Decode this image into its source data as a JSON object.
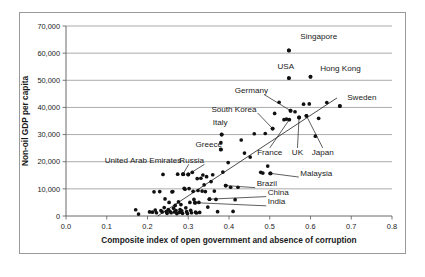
{
  "chart_data": {
    "type": "scatter",
    "title": "",
    "xlabel": "Composite index of open government and absence of corruption",
    "ylabel": "Non-oil GDP per capita",
    "xlim": [
      0.0,
      0.8
    ],
    "ylim": [
      0,
      70000
    ],
    "xticks": [
      "0.0",
      "0.1",
      "0.2",
      "0.3",
      "0.4",
      "0.5",
      "0.6",
      "0.7",
      "0.8"
    ],
    "xtick_values": [
      0.0,
      0.1,
      0.2,
      0.3,
      0.4,
      0.5,
      0.6,
      0.7,
      0.8
    ],
    "yticks": [
      "0",
      "10,000",
      "20,000",
      "30,000",
      "40,000",
      "50,000",
      "60,000",
      "70,000"
    ],
    "ytick_values": [
      0,
      10000,
      20000,
      30000,
      40000,
      50000,
      60000,
      70000
    ],
    "grid": "horizontal",
    "legend": "none",
    "marker_color": "#111111",
    "trendline": {
      "label": "linear fit",
      "x0": 0.225,
      "y0": 0,
      "x1": 0.665,
      "y1": 43500
    },
    "annotations": [
      {
        "name": "Singapore",
        "x": 0.547,
        "y": 61000,
        "label_x": 0.575,
        "label_y": 65200,
        "anchor": "start",
        "leader": false
      },
      {
        "name": "USA",
        "x": 0.547,
        "y": 50800,
        "label_x": 0.519,
        "label_y": 54300,
        "anchor": "start",
        "leader": false
      },
      {
        "name": "Hong Kong",
        "x": 0.6,
        "y": 51300,
        "label_x": 0.624,
        "label_y": 53600,
        "anchor": "start",
        "leader": false
      },
      {
        "name": "Germany",
        "x": 0.551,
        "y": 38800,
        "label_x": 0.414,
        "label_y": 45300,
        "anchor": "start",
        "leader": true
      },
      {
        "name": "Sweden",
        "x": 0.672,
        "y": 40500,
        "label_x": 0.69,
        "label_y": 42600,
        "anchor": "start",
        "leader": false
      },
      {
        "name": "South Korea",
        "x": 0.507,
        "y": 32200,
        "label_x": 0.357,
        "label_y": 38500,
        "anchor": "start",
        "leader": true
      },
      {
        "name": "Italy",
        "x": 0.382,
        "y": 30000,
        "label_x": 0.36,
        "label_y": 33400,
        "anchor": "start",
        "leader": false
      },
      {
        "name": "Greece",
        "x": 0.38,
        "y": 24500,
        "label_x": 0.318,
        "label_y": 25600,
        "anchor": "start",
        "leader": false
      },
      {
        "name": "France",
        "x": 0.548,
        "y": 35500,
        "label_x": 0.5,
        "label_y": 22500,
        "anchor": "middle",
        "leader": true
      },
      {
        "name": "UK",
        "x": 0.572,
        "y": 36300,
        "label_x": 0.568,
        "label_y": 22500,
        "anchor": "middle",
        "leader": true
      },
      {
        "name": "Japan",
        "x": 0.59,
        "y": 36900,
        "label_x": 0.63,
        "label_y": 22500,
        "anchor": "middle",
        "leader": true
      },
      {
        "name": "United Arab Emirates",
        "x": 0.287,
        "y": 15400,
        "label_x": 0.095,
        "label_y": 19600,
        "anchor": "start",
        "leader": true
      },
      {
        "name": "Russia",
        "x": 0.3,
        "y": 15300,
        "label_x": 0.278,
        "label_y": 19600,
        "anchor": "start",
        "leader": true
      },
      {
        "name": "Malaysia",
        "x": 0.502,
        "y": 15700,
        "label_x": 0.575,
        "label_y": 14900,
        "anchor": "start",
        "leader": true
      },
      {
        "name": "Brazil",
        "x": 0.392,
        "y": 11200,
        "label_x": 0.468,
        "label_y": 11000,
        "anchor": "start",
        "leader": true
      },
      {
        "name": "China",
        "x": 0.352,
        "y": 6200,
        "label_x": 0.495,
        "label_y": 7700,
        "anchor": "start",
        "leader": true
      },
      {
        "name": "India",
        "x": 0.317,
        "y": 4900,
        "label_x": 0.495,
        "label_y": 4300,
        "anchor": "start",
        "leader": true
      }
    ],
    "points": [
      [
        0.171,
        2300
      ],
      [
        0.178,
        700
      ],
      [
        0.205,
        1500
      ],
      [
        0.212,
        1400
      ],
      [
        0.216,
        8900
      ],
      [
        0.219,
        2200
      ],
      [
        0.222,
        1200
      ],
      [
        0.23,
        9000
      ],
      [
        0.233,
        2000
      ],
      [
        0.236,
        1500
      ],
      [
        0.238,
        15300
      ],
      [
        0.241,
        3100
      ],
      [
        0.243,
        6300
      ],
      [
        0.246,
        1600
      ],
      [
        0.248,
        1000
      ],
      [
        0.251,
        2400
      ],
      [
        0.253,
        5000
      ],
      [
        0.255,
        1700
      ],
      [
        0.258,
        1200
      ],
      [
        0.26,
        8900
      ],
      [
        0.262,
        9000
      ],
      [
        0.264,
        2900
      ],
      [
        0.266,
        1500
      ],
      [
        0.268,
        3900
      ],
      [
        0.27,
        2000
      ],
      [
        0.272,
        900
      ],
      [
        0.274,
        15400
      ],
      [
        0.276,
        5200
      ],
      [
        0.278,
        1300
      ],
      [
        0.28,
        2400
      ],
      [
        0.282,
        4200
      ],
      [
        0.284,
        1900
      ],
      [
        0.286,
        1000
      ],
      [
        0.288,
        15400
      ],
      [
        0.29,
        10200
      ],
      [
        0.292,
        9900
      ],
      [
        0.294,
        3000
      ],
      [
        0.296,
        1600
      ],
      [
        0.298,
        900
      ],
      [
        0.3,
        15300
      ],
      [
        0.302,
        10100
      ],
      [
        0.304,
        5000
      ],
      [
        0.306,
        2100
      ],
      [
        0.308,
        1200
      ],
      [
        0.31,
        16100
      ],
      [
        0.312,
        9100
      ],
      [
        0.314,
        6100
      ],
      [
        0.316,
        4900
      ],
      [
        0.318,
        1400
      ],
      [
        0.32,
        1100
      ],
      [
        0.322,
        13800
      ],
      [
        0.324,
        9400
      ],
      [
        0.326,
        5000
      ],
      [
        0.328,
        1300
      ],
      [
        0.331,
        13900
      ],
      [
        0.334,
        9200
      ],
      [
        0.336,
        15100
      ],
      [
        0.339,
        11500
      ],
      [
        0.342,
        9000
      ],
      [
        0.345,
        14500
      ],
      [
        0.348,
        3300
      ],
      [
        0.352,
        6200
      ],
      [
        0.356,
        12700
      ],
      [
        0.36,
        15200
      ],
      [
        0.364,
        9200
      ],
      [
        0.368,
        6100
      ],
      [
        0.372,
        1600
      ],
      [
        0.38,
        24500
      ],
      [
        0.38,
        27000
      ],
      [
        0.382,
        30000
      ],
      [
        0.385,
        16200
      ],
      [
        0.392,
        11200
      ],
      [
        0.398,
        19700
      ],
      [
        0.404,
        10600
      ],
      [
        0.41,
        1700
      ],
      [
        0.415,
        6000
      ],
      [
        0.422,
        10600
      ],
      [
        0.43,
        28000
      ],
      [
        0.438,
        23200
      ],
      [
        0.452,
        21700
      ],
      [
        0.462,
        30300
      ],
      [
        0.478,
        16100
      ],
      [
        0.483,
        15800
      ],
      [
        0.489,
        30400
      ],
      [
        0.495,
        18400
      ],
      [
        0.501,
        15700
      ],
      [
        0.507,
        32200
      ],
      [
        0.512,
        37800
      ],
      [
        0.523,
        41900
      ],
      [
        0.535,
        35500
      ],
      [
        0.541,
        35700
      ],
      [
        0.547,
        50800
      ],
      [
        0.547,
        61000
      ],
      [
        0.551,
        38800
      ],
      [
        0.562,
        38400
      ],
      [
        0.572,
        36300
      ],
      [
        0.583,
        41200
      ],
      [
        0.59,
        36900
      ],
      [
        0.597,
        41300
      ],
      [
        0.6,
        51300
      ],
      [
        0.612,
        29400
      ],
      [
        0.62,
        36000
      ],
      [
        0.64,
        41800
      ],
      [
        0.672,
        40500
      ]
    ]
  }
}
